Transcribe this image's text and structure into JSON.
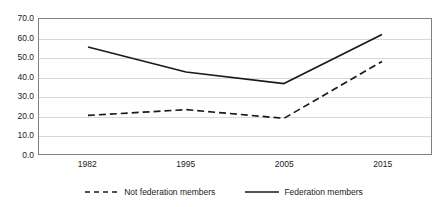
{
  "chart_data": {
    "type": "line",
    "title": "",
    "xlabel": "",
    "ylabel": "",
    "categories": [
      "1982",
      "1995",
      "2005",
      "2015"
    ],
    "ylim": [
      0.0,
      70.0
    ],
    "ytick_step": 10.0,
    "yticks": [
      "0.0",
      "10.0",
      "20.0",
      "30.0",
      "40.0",
      "50.0",
      "60.0",
      "70.0"
    ],
    "ytick_values": [
      0.0,
      10.0,
      20.0,
      30.0,
      40.0,
      50.0,
      60.0,
      70.0
    ],
    "grid": true,
    "grid_axis": "y",
    "legend_position": "bottom",
    "series": [
      {
        "name": "Not federation members",
        "style": "dashed",
        "color": "#1a1a1a",
        "values": [
          20.0,
          23.0,
          18.5,
          48.0
        ]
      },
      {
        "name": "Federation members",
        "style": "solid",
        "color": "#1a1a1a",
        "values": [
          55.5,
          42.5,
          36.5,
          62.0
        ]
      }
    ]
  },
  "legend": {
    "entries": [
      {
        "label": "Not federation members",
        "style": "dashed"
      },
      {
        "label": "Federation members",
        "style": "solid"
      }
    ]
  },
  "colors": {
    "line": "#1a1a1a",
    "grid": "#d9d9d9",
    "frame": "#808080",
    "text": "#1a1a1a",
    "background": "#ffffff"
  }
}
